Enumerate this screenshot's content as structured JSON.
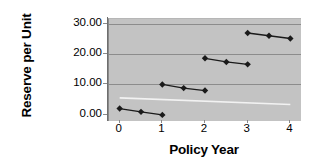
{
  "chart_data": {
    "type": "line",
    "title": "",
    "xlabel": "Policy Year",
    "ylabel": "Reserve per Unit",
    "xlim": [
      -0.25,
      4.25
    ],
    "ylim": [
      -2.0,
      31.5
    ],
    "grid": "horizontal",
    "legend": "none",
    "plot_background": "#c3c3c3",
    "series_color": "#1a1a1a",
    "gridline_color": "#8c8c8c",
    "reference_line_color": "#f2f2f2",
    "yticks": [
      {
        "value": 0,
        "label": "0.00"
      },
      {
        "value": 10,
        "label": "10.00"
      },
      {
        "value": 20,
        "label": "20.00"
      },
      {
        "value": 30,
        "label": "30.00"
      }
    ],
    "xticks": [
      {
        "value": 0,
        "label": "0"
      },
      {
        "value": 1,
        "label": "1"
      },
      {
        "value": 2,
        "label": "2"
      },
      {
        "value": 3,
        "label": "3"
      },
      {
        "value": 4,
        "label": "4"
      }
    ],
    "series": [
      {
        "name": "reserve-year-1",
        "x": [
          0,
          0.5,
          1
        ],
        "values": [
          2.1,
          1.0,
          0.0
        ]
      },
      {
        "name": "reserve-year-2",
        "x": [
          1,
          1.5,
          2
        ],
        "values": [
          10.0,
          8.8,
          8.0
        ]
      },
      {
        "name": "reserve-year-3",
        "x": [
          2,
          2.5,
          3
        ],
        "values": [
          18.6,
          17.4,
          16.6
        ]
      },
      {
        "name": "reserve-year-4",
        "x": [
          3,
          3.5,
          4
        ],
        "values": [
          26.9,
          26.0,
          25.1
        ]
      }
    ],
    "reference_line": {
      "name": "lower-boundary-line",
      "x": [
        0,
        4
      ],
      "values": [
        5.6,
        3.4
      ]
    },
    "marker": "diamond",
    "marker_size": 3.2
  }
}
